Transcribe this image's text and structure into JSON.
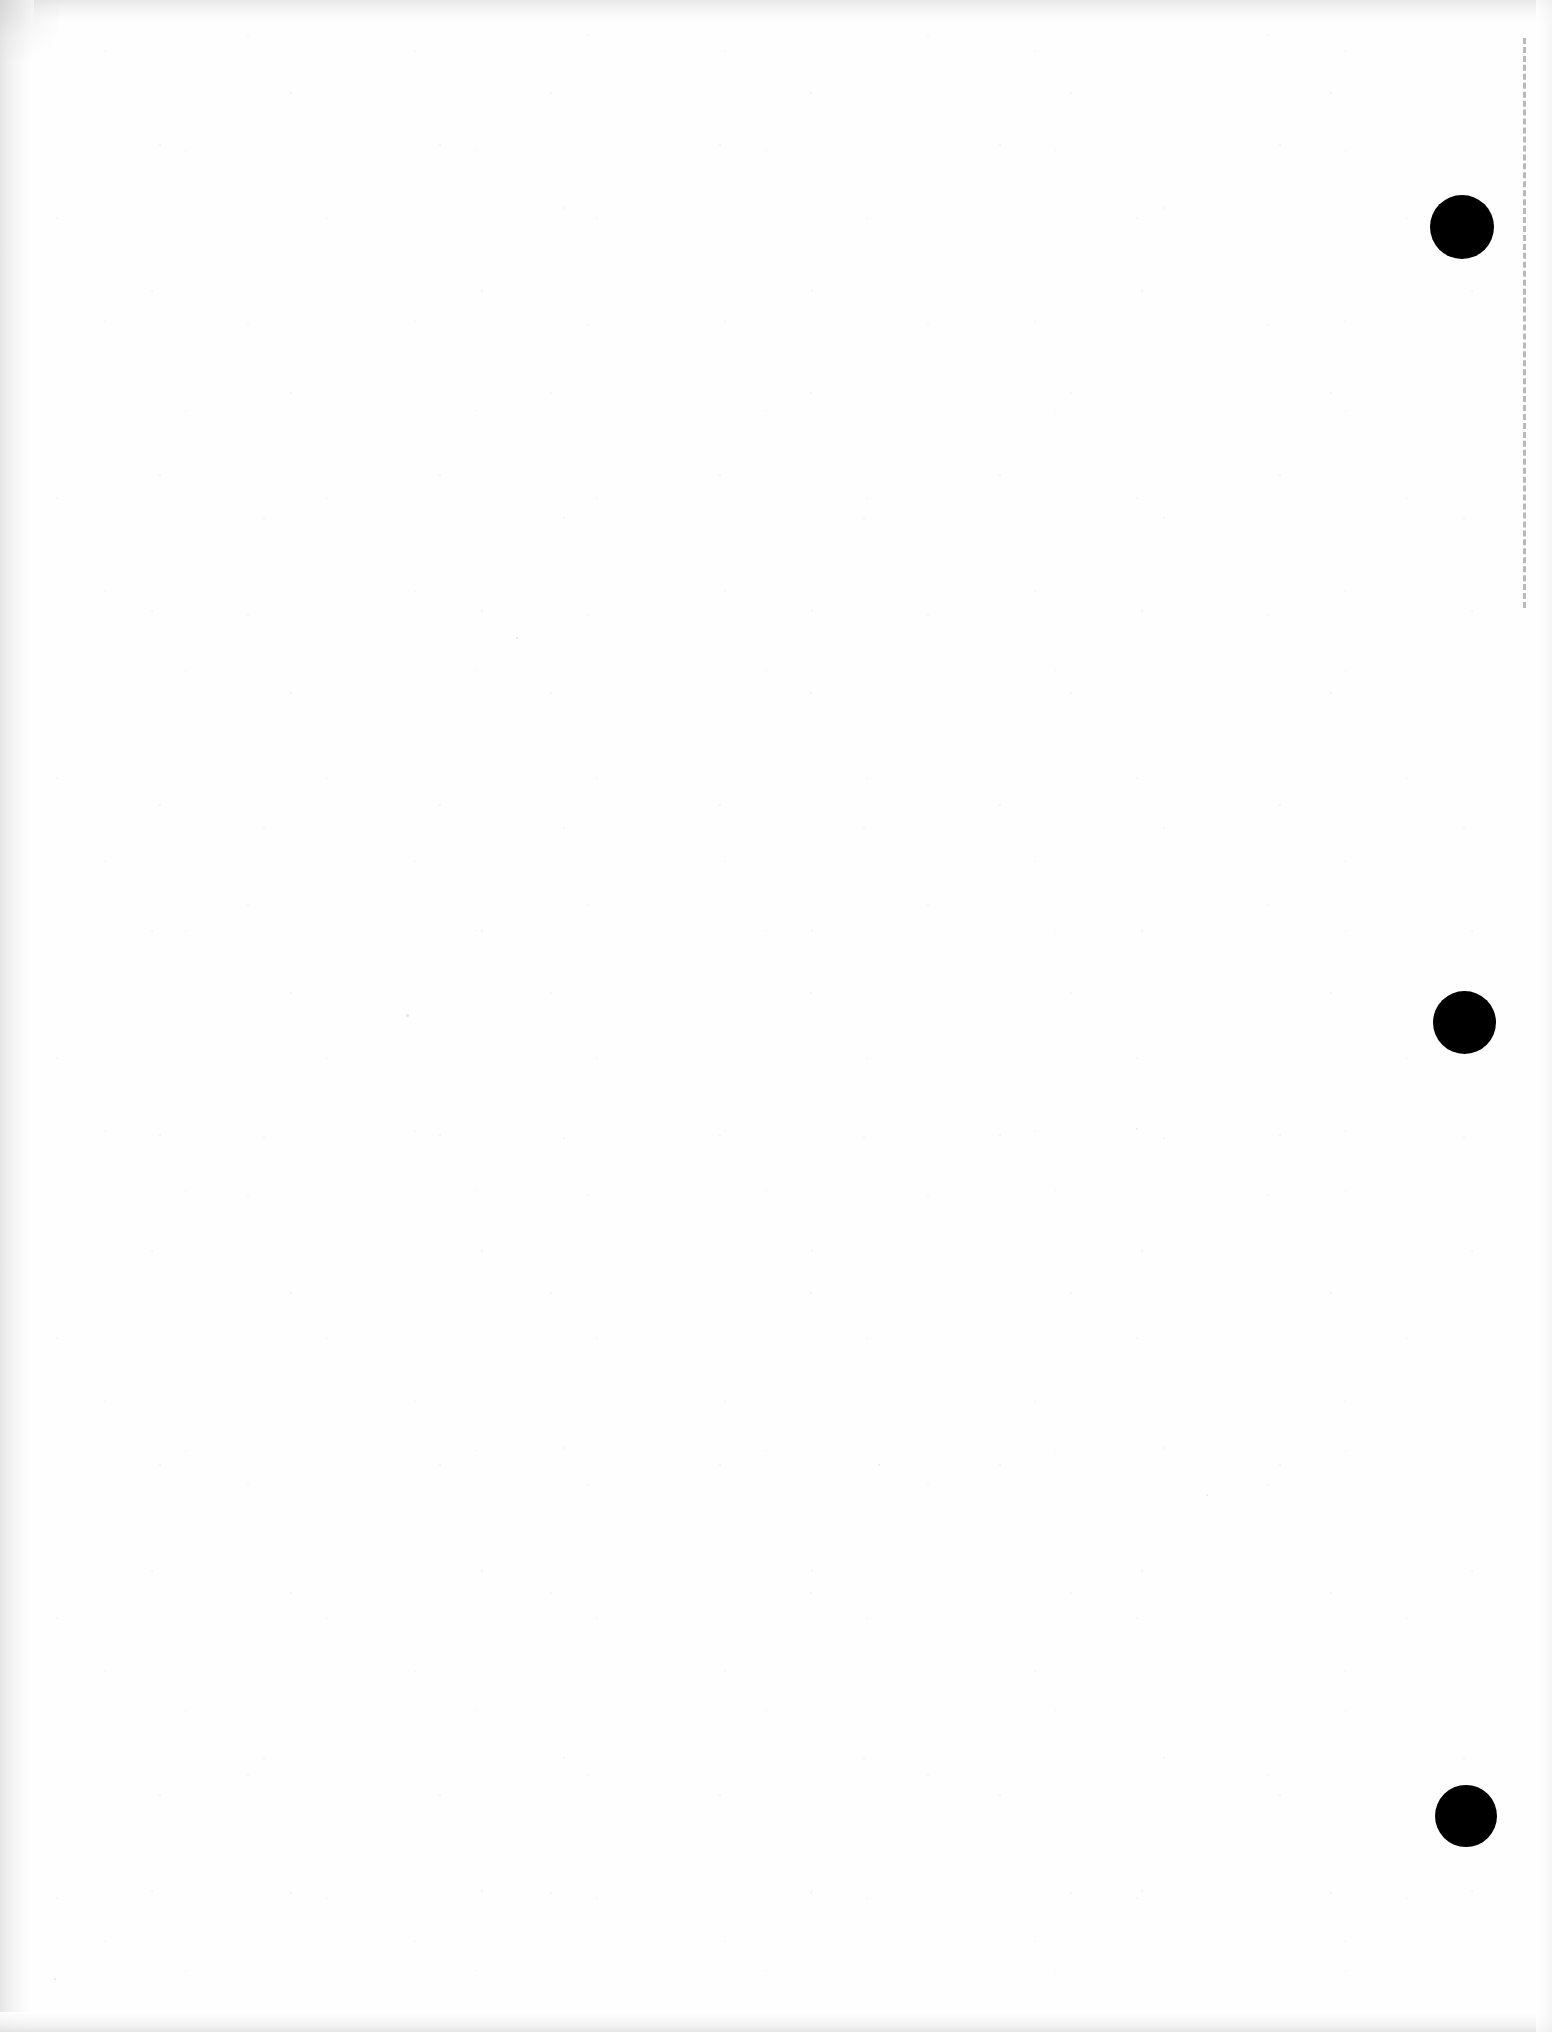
{
  "document": {
    "title": "Scanned page",
    "page_kind": "blank-scanned-sheet",
    "page_width_px": 1552,
    "page_height_px": 2032,
    "body_text": "",
    "visible_text": "",
    "background_color": "#ffffff",
    "paper_tone_color": "#fefefe"
  },
  "marks": {
    "ink_color": "#000000",
    "punch_holes": [
      {
        "label": "top-punch-hole",
        "cx": 1462,
        "cy": 227,
        "diameter": 64
      },
      {
        "label": "middle-punch-hole",
        "cx": 1464,
        "cy": 1022,
        "diameter": 63
      },
      {
        "label": "bottom-punch-hole",
        "cx": 1466,
        "cy": 1816,
        "diameter": 62
      }
    ],
    "guide_line": {
      "label": "right-margin-dashed-line",
      "x": 1523,
      "y_start": 38,
      "y_end": 608,
      "style": "dashed",
      "color": "#b9b9b9",
      "thickness": 3
    },
    "specks": [
      {
        "x": 406,
        "y": 1014,
        "size": 3
      },
      {
        "x": 516,
        "y": 637,
        "size": 2
      },
      {
        "x": 1136,
        "y": 1128,
        "size": 2
      },
      {
        "x": 54,
        "y": 1978,
        "size": 2
      },
      {
        "x": 1206,
        "y": 1494,
        "size": 2
      },
      {
        "x": 878,
        "y": 1464,
        "size": 2
      }
    ]
  },
  "scan_edges": {
    "top_shadow_color": "#e6e6e6",
    "left_shadow_color": "#e4e4e4",
    "bottom_shadow_color": "#e2e2e2",
    "right_shadow_color": "#f2f2f2"
  }
}
